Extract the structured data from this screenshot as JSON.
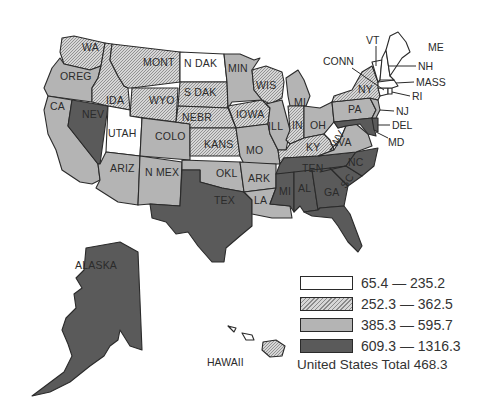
{
  "map": {
    "title": "",
    "classes": [
      {
        "id": "c1",
        "range": "65.4 — 235.2",
        "fill": "#ffffff",
        "pattern": "none"
      },
      {
        "id": "c2",
        "range": "252.3 — 362.5",
        "fill": "#c8c8c8",
        "pattern": "hatch"
      },
      {
        "id": "c3",
        "range": "385.3 — 595.7",
        "fill": "#b4b4b4",
        "pattern": "solid"
      },
      {
        "id": "c4",
        "range": "609.3 — 1316.3",
        "fill": "#5a5a5a",
        "pattern": "solid"
      }
    ],
    "total_label": "United States Total 468.3",
    "states": {
      "WA": {
        "label": "WA",
        "class": "c2"
      },
      "OREG": {
        "label": "OREG",
        "class": "c3"
      },
      "CA": {
        "label": "CA",
        "class": "c3"
      },
      "NEV": {
        "label": "NEV",
        "class": "c4"
      },
      "IDA": {
        "label": "IDA",
        "class": "c2"
      },
      "MONT": {
        "label": "MONT",
        "class": "c2"
      },
      "WYO": {
        "label": "WYO",
        "class": "c2"
      },
      "UTAH": {
        "label": "UTAH",
        "class": "c1"
      },
      "COLO": {
        "label": "COLO",
        "class": "c3"
      },
      "ARIZ": {
        "label": "ARIZ",
        "class": "c3"
      },
      "N MEX": {
        "label": "N MEX",
        "class": "c3"
      },
      "N DAK": {
        "label": "N DAK",
        "class": "c1"
      },
      "S DAK": {
        "label": "S DAK",
        "class": "c2"
      },
      "NEBR": {
        "label": "NEBR",
        "class": "c2"
      },
      "KANS": {
        "label": "KANS",
        "class": "c2"
      },
      "OKL": {
        "label": "OKL",
        "class": "c3"
      },
      "TEX": {
        "label": "TEX",
        "class": "c4"
      },
      "MIN": {
        "label": "MIN",
        "class": "c3"
      },
      "IOWA": {
        "label": "IOWA",
        "class": "c2"
      },
      "MO": {
        "label": "MO",
        "class": "c3"
      },
      "ARK": {
        "label": "ARK",
        "class": "c3"
      },
      "LA": {
        "label": "LA",
        "class": "c3"
      },
      "WIS": {
        "label": "WIS",
        "class": "c2"
      },
      "ILL": {
        "label": "ILL",
        "class": "c3"
      },
      "MI": {
        "label": "MI",
        "class": "c3"
      },
      "IN": {
        "label": "IN",
        "class": "c2"
      },
      "OH": {
        "label": "OH",
        "class": "c3"
      },
      "KY": {
        "label": "KY",
        "class": "c2"
      },
      "TEN": {
        "label": "TEN",
        "class": "c4"
      },
      "MISS": {
        "label": "MI",
        "class": "c4"
      },
      "AL": {
        "label": "AL",
        "class": "c4"
      },
      "GA": {
        "label": "GA",
        "class": "c4"
      },
      "FL": {
        "label": "FL",
        "class": "c4"
      },
      "SC": {
        "label": "SC",
        "class": "c4"
      },
      "NC": {
        "label": "NC",
        "class": "c4"
      },
      "VA": {
        "label": "VA",
        "class": "c3"
      },
      "WV": {
        "label": "WV",
        "class": "c1"
      },
      "PA": {
        "label": "PA",
        "class": "c3"
      },
      "NY": {
        "label": "NY",
        "class": "c2"
      },
      "NJ": {
        "label": "NJ",
        "class": "c3"
      },
      "DEL": {
        "label": "DEL",
        "class": "c4"
      },
      "MD": {
        "label": "MD",
        "class": "c4"
      },
      "CONN": {
        "label": "CONN",
        "class": "c1"
      },
      "RI": {
        "label": "RI",
        "class": "c1"
      },
      "MASS": {
        "label": "MASS",
        "class": "c1"
      },
      "VT": {
        "label": "VT",
        "class": "c1"
      },
      "NH": {
        "label": "NH",
        "class": "c1"
      },
      "ME": {
        "label": "ME",
        "class": "c1"
      },
      "ALASKA": {
        "label": "ALASKA",
        "class": "c4"
      },
      "HAWAII": {
        "label": "HAWAII",
        "class": "c2"
      }
    }
  }
}
